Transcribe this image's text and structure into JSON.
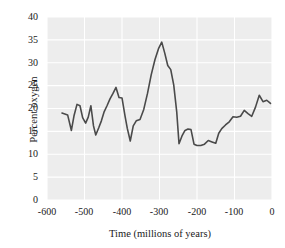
{
  "chart_data": {
    "type": "line",
    "title": "",
    "xlabel": "Time (millions of years)",
    "ylabel": "Percent oxygen",
    "xlim": [
      -600,
      0
    ],
    "ylim": [
      0,
      40
    ],
    "xticks": [
      "-600",
      "-500",
      "-400",
      "-300",
      "-200",
      "-100",
      "0"
    ],
    "yticks": [
      "0",
      "5",
      "10",
      "15",
      "20",
      "25",
      "30",
      "35",
      "40"
    ],
    "grid": true,
    "legend": "none",
    "line_color": "#4a4a4a",
    "plot_background": "#ededed",
    "gridline_color": "#ffffff",
    "series": [
      {
        "name": "Percent oxygen",
        "x": [
          -560,
          -545,
          -535,
          -528,
          -520,
          -512,
          -505,
          -497,
          -490,
          -483,
          -476,
          -470,
          -462,
          -455,
          -448,
          -440,
          -432,
          -424,
          -416,
          -408,
          -400,
          -392,
          -386,
          -378,
          -370,
          -362,
          -352,
          -342,
          -332,
          -322,
          -312,
          -302,
          -294,
          -286,
          -278,
          -270,
          -262,
          -254,
          -248,
          -240,
          -232,
          -224,
          -216,
          -208,
          -200,
          -190,
          -180,
          -170,
          -160,
          -150,
          -142,
          -134,
          -124,
          -114,
          -104,
          -94,
          -84,
          -74,
          -64,
          -54,
          -44,
          -34,
          -24,
          -14,
          -4
        ],
        "y": [
          19.0,
          18.6,
          15.2,
          18.4,
          20.9,
          20.6,
          18.0,
          16.8,
          18.1,
          20.6,
          16.2,
          14.2,
          15.8,
          17.3,
          19.2,
          20.6,
          22.1,
          23.3,
          24.6,
          22.4,
          22.3,
          18.4,
          15.7,
          12.9,
          16.2,
          17.3,
          17.6,
          19.8,
          23.3,
          27.4,
          30.7,
          33.2,
          34.5,
          32.1,
          29.4,
          28.5,
          25.1,
          19.2,
          12.3,
          14.0,
          15.2,
          15.5,
          15.4,
          12.2,
          11.9,
          11.9,
          12.2,
          13.0,
          12.7,
          12.4,
          14.6,
          15.6,
          16.4,
          17.1,
          18.2,
          18.1,
          18.3,
          19.6,
          18.9,
          18.3,
          20.3,
          22.9,
          21.5,
          21.8,
          21.1
        ]
      }
    ]
  }
}
